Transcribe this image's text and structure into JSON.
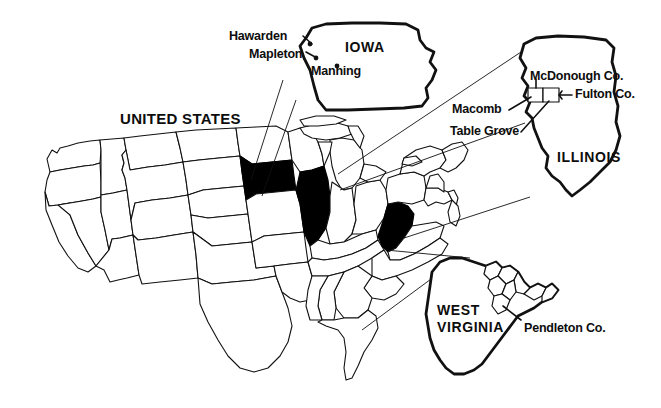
{
  "figure": {
    "kind": "reference-map",
    "background_color": "#ffffff",
    "ink_color": "#0d0d0d",
    "highlight_fill": "#000000",
    "width": 661,
    "height": 408
  },
  "main_map": {
    "title": "UNITED STATES",
    "highlighted_states": [
      "IOWA",
      "ILLINOIS",
      "WEST VIRGINIA"
    ]
  },
  "insets": [
    {
      "id": "iowa",
      "state_label": "IOWA",
      "places": [
        {
          "name": "Hawarden"
        },
        {
          "name": "Mapleton"
        },
        {
          "name": "Manning"
        }
      ]
    },
    {
      "id": "illinois",
      "state_label": "ILLINOIS",
      "counties": [
        {
          "name": "McDonough Co."
        },
        {
          "name": "Fulton Co."
        }
      ],
      "places": [
        {
          "name": "Macomb"
        },
        {
          "name": "Table Grove"
        }
      ]
    },
    {
      "id": "west-virginia",
      "state_label_line1": "WEST",
      "state_label_line2": "VIRGINIA",
      "counties": [
        {
          "name": "Pendleton Co."
        }
      ]
    }
  ]
}
